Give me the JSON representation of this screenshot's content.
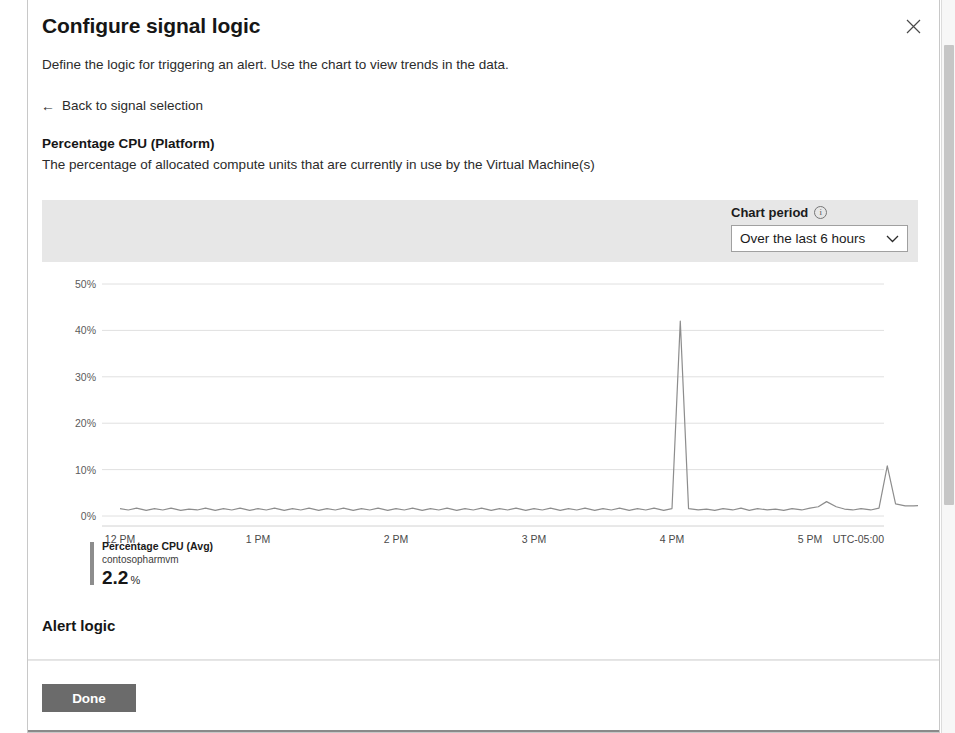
{
  "blade": {
    "title": "Configure signal logic",
    "subtitle": "Define the logic for triggering an alert. Use the chart to view trends in the data.",
    "back_link": "Back to signal selection",
    "back_arrow": "←",
    "close_label": "×",
    "signal_name": "Percentage CPU (Platform)",
    "signal_description": "The percentage of allocated compute units that are currently in use by the Virtual Machine(s)",
    "section_alert_logic": "Alert logic"
  },
  "chart_toolbar": {
    "period_label": "Chart period",
    "info_glyph": "i",
    "period_value": "Over the last 6 hours",
    "chevron": "⌄"
  },
  "legend": {
    "metric": "Percentage CPU (Avg)",
    "resource": "contosopharmvm",
    "value": "2.2",
    "unit": "%",
    "swatch_color": "#8d8d8d"
  },
  "footer": {
    "done_label": "Done"
  },
  "colors": {
    "toolbar_band": "#e7e7e7",
    "line": "#8d8d8d",
    "grid": "#e0e0e0",
    "done_button": "#6b6b6b",
    "scrollbar_thumb": "#c6c6c6"
  },
  "chart_data": {
    "type": "line",
    "title": "Percentage CPU (Avg)",
    "subtitle": "contosopharmvm",
    "xlabel": "",
    "ylabel": "",
    "timezone": "UTC-05:00",
    "grid": true,
    "legend_position": "bottom-left",
    "xlim": [
      "12 PM",
      "6 PM"
    ],
    "ylim": [
      0,
      50
    ],
    "yticks": [
      0,
      10,
      20,
      30,
      40,
      50
    ],
    "ytick_labels": [
      "0%",
      "10%",
      "20%",
      "30%",
      "40%",
      "50%"
    ],
    "xticks": [
      "12 PM",
      "1 PM",
      "2 PM",
      "3 PM",
      "4 PM",
      "5 PM"
    ],
    "series": [
      {
        "name": "Percentage CPU (Avg)",
        "resource": "contosopharmvm",
        "color": "#8d8d8d",
        "current_value": 2.2,
        "unit": "%",
        "x": [
          0.0,
          0.06,
          0.12,
          0.19,
          0.25,
          0.31,
          0.37,
          0.44,
          0.5,
          0.56,
          0.62,
          0.69,
          0.75,
          0.81,
          0.87,
          0.94,
          1.0,
          1.06,
          1.12,
          1.19,
          1.25,
          1.31,
          1.37,
          1.44,
          1.5,
          1.56,
          1.62,
          1.69,
          1.75,
          1.81,
          1.87,
          1.94,
          2.0,
          2.06,
          2.12,
          2.19,
          2.25,
          2.31,
          2.37,
          2.44,
          2.5,
          2.56,
          2.62,
          2.69,
          2.75,
          2.81,
          2.87,
          2.94,
          3.0,
          3.06,
          3.12,
          3.19,
          3.25,
          3.31,
          3.37,
          3.44,
          3.5,
          3.56,
          3.62,
          3.69,
          3.75,
          3.81,
          3.87,
          3.94,
          4.0,
          4.06,
          4.12,
          4.19,
          4.25,
          4.31,
          4.37,
          4.44,
          4.5,
          4.56,
          4.62,
          4.69,
          4.75,
          4.81,
          4.87,
          4.94,
          5.0,
          5.06,
          5.12,
          5.19,
          5.25,
          5.31,
          5.37,
          5.44,
          5.5,
          5.56,
          5.62,
          5.69,
          5.75,
          5.81,
          5.87
        ],
        "y": [
          1.6,
          1.3,
          1.7,
          1.2,
          1.6,
          1.3,
          1.7,
          1.2,
          1.5,
          1.3,
          1.7,
          1.2,
          1.6,
          1.3,
          1.7,
          1.2,
          1.6,
          1.3,
          1.7,
          1.2,
          1.6,
          1.3,
          1.7,
          1.2,
          1.6,
          1.3,
          1.7,
          1.2,
          1.6,
          1.3,
          1.7,
          1.2,
          1.6,
          1.3,
          1.7,
          1.2,
          1.6,
          1.3,
          1.7,
          1.2,
          1.6,
          1.3,
          1.7,
          1.2,
          1.6,
          1.3,
          1.7,
          1.2,
          1.6,
          1.3,
          1.7,
          1.2,
          1.6,
          1.3,
          1.7,
          1.2,
          1.6,
          1.3,
          1.7,
          1.2,
          1.6,
          1.3,
          1.7,
          1.2,
          1.6,
          42.0,
          1.6,
          1.3,
          1.5,
          1.2,
          1.6,
          1.3,
          1.7,
          1.2,
          1.6,
          1.3,
          1.5,
          1.2,
          1.6,
          1.3,
          1.7,
          2.0,
          3.1,
          2.0,
          1.5,
          1.3,
          1.6,
          1.3,
          1.7,
          10.8,
          2.6,
          2.2,
          2.2,
          2.3,
          2.2
        ]
      }
    ],
    "markers": [
      {
        "name": "current-value-marker",
        "x": 5.87,
        "y": 2.2
      }
    ]
  }
}
